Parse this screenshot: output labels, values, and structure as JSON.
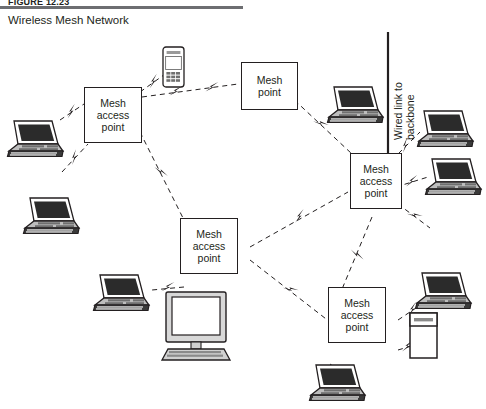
{
  "figure": {
    "label": "FIGURE 12.23",
    "title": "Wireless Mesh Network"
  },
  "diagram": {
    "type": "network-topology",
    "link_styles": {
      "wireless": "dashed line with lightning-bolt glyph",
      "wired": "solid line to backbone bar"
    },
    "colors": {
      "ink": "#231f20",
      "rule": "#6d6e71",
      "background": "#ffffff",
      "device_fill": "#d8d8d8",
      "screen_fill": "#2b2b2b"
    },
    "nodes": [
      {
        "id": "ap-left",
        "label_lines": [
          "Mesh",
          "access",
          "point"
        ],
        "kind": "mesh-access-point"
      },
      {
        "id": "mp-top",
        "label_lines": [
          "Mesh",
          "point"
        ],
        "kind": "mesh-point"
      },
      {
        "id": "ap-right",
        "label_lines": [
          "Mesh",
          "access",
          "point"
        ],
        "kind": "mesh-access-point"
      },
      {
        "id": "ap-center",
        "label_lines": [
          "Mesh",
          "access",
          "point"
        ],
        "kind": "mesh-access-point"
      },
      {
        "id": "ap-bottom",
        "label_lines": [
          "Mesh",
          "access",
          "point"
        ],
        "kind": "mesh-access-point"
      }
    ],
    "wired_link": {
      "caption_lines": [
        "Wired link to",
        "backbone"
      ]
    },
    "clients": [
      {
        "id": "phone-top",
        "kind": "mobile-phone"
      },
      {
        "id": "laptop-left-top",
        "kind": "laptop"
      },
      {
        "id": "laptop-left-mid",
        "kind": "laptop"
      },
      {
        "id": "laptop-left-low",
        "kind": "laptop"
      },
      {
        "id": "laptop-top-right",
        "kind": "laptop"
      },
      {
        "id": "laptop-right-a",
        "kind": "laptop"
      },
      {
        "id": "laptop-right-b",
        "kind": "laptop"
      },
      {
        "id": "laptop-right-low",
        "kind": "laptop"
      },
      {
        "id": "laptop-bottom",
        "kind": "laptop"
      },
      {
        "id": "desktop-center",
        "kind": "desktop-computer"
      },
      {
        "id": "server-right",
        "kind": "server-tower"
      }
    ]
  }
}
